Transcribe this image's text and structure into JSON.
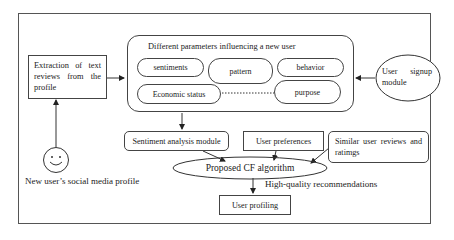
{
  "diagram": {
    "extraction_box": {
      "label": "Extraction of text reviews from the profile"
    },
    "parameters_group": {
      "title": "Different parameters influencing a new user",
      "items": [
        {
          "label": "sentiments"
        },
        {
          "label": "pattern"
        },
        {
          "label": "behavior"
        },
        {
          "label": "Economic status"
        },
        {
          "label": "purpose"
        }
      ]
    },
    "signup_node": {
      "label": "User signup module"
    },
    "new_user_node": {
      "label": "New user’s social media profile",
      "icon": "smiley-face-icon"
    },
    "sentiment_module": {
      "label": "Sentiment analysis module"
    },
    "user_preferences": {
      "label": "User preferences"
    },
    "similar_reviews": {
      "label": "Similar user reviews and ratimgs"
    },
    "cf_algorithm": {
      "label": "Proposed CF algorithm"
    },
    "output_label": {
      "label": "High-quality recommendations"
    },
    "user_profiling": {
      "label": "User profiling"
    },
    "edges": [
      {
        "from": "new_user_node",
        "to": "extraction_box"
      },
      {
        "from": "extraction_box",
        "to": "parameters_group"
      },
      {
        "from": "signup_node",
        "to": "parameters_group"
      },
      {
        "from": "parameters_group",
        "to": "sentiment_module"
      },
      {
        "from": "sentiment_module",
        "to": "cf_algorithm"
      },
      {
        "from": "user_preferences",
        "to": "cf_algorithm"
      },
      {
        "from": "similar_reviews",
        "to": "cf_algorithm"
      },
      {
        "from": "cf_algorithm",
        "to": "user_profiling"
      },
      {
        "from": "Economic status",
        "to": "purpose",
        "style": "dotted"
      }
    ]
  }
}
